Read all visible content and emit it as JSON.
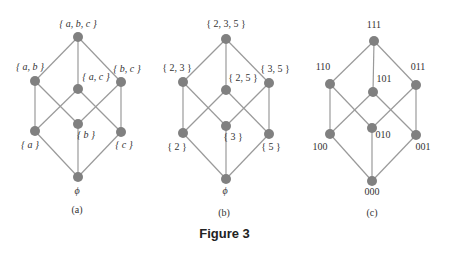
{
  "caption": "Figure   3",
  "colors": {
    "edge": "#9a9a9a",
    "node": "#808080",
    "text": "#333333"
  },
  "diagrams": [
    {
      "id": "a",
      "sublabel": "(a)",
      "nodes": [
        {
          "id": "abc",
          "label": "{ a, b, c }",
          "x": 78,
          "y": 37
        },
        {
          "id": "ab",
          "label": "{ a, b }",
          "x": 35,
          "y": 81
        },
        {
          "id": "ac",
          "label": "{ a, c }",
          "x": 78,
          "y": 89
        },
        {
          "id": "bc",
          "label": "{ b, c }",
          "x": 121,
          "y": 82
        },
        {
          "id": "a",
          "label": "{ a }",
          "x": 35,
          "y": 131
        },
        {
          "id": "b",
          "label": "{ b }",
          "x": 78,
          "y": 124
        },
        {
          "id": "c",
          "label": "{ c }",
          "x": 121,
          "y": 132
        },
        {
          "id": "empty",
          "label": "ϕ",
          "x": 78,
          "y": 177
        }
      ]
    },
    {
      "id": "b",
      "sublabel": "(b)",
      "nodes": [
        {
          "id": "235",
          "label": "{ 2, 3, 5 }",
          "x": 226,
          "y": 39
        },
        {
          "id": "23",
          "label": "{ 2, 3 }",
          "x": 183,
          "y": 82
        },
        {
          "id": "25",
          "label": "{ 2, 5 }",
          "x": 226,
          "y": 90
        },
        {
          "id": "35",
          "label": "{ 3, 5 }",
          "x": 269,
          "y": 83
        },
        {
          "id": "2",
          "label": "{ 2 }",
          "x": 183,
          "y": 133
        },
        {
          "id": "3",
          "label": "{ 3 }",
          "x": 226,
          "y": 126
        },
        {
          "id": "5",
          "label": "{ 5 }",
          "x": 269,
          "y": 134
        },
        {
          "id": "empty",
          "label": "ϕ",
          "x": 226,
          "y": 179
        }
      ]
    },
    {
      "id": "c",
      "sublabel": "(c)",
      "nodes": [
        {
          "id": "111",
          "label": "111",
          "x": 374,
          "y": 41
        },
        {
          "id": "110",
          "label": "110",
          "x": 330,
          "y": 84
        },
        {
          "id": "101",
          "label": "101",
          "x": 373,
          "y": 92
        },
        {
          "id": "011",
          "label": "011",
          "x": 416,
          "y": 85
        },
        {
          "id": "100",
          "label": "100",
          "x": 330,
          "y": 134
        },
        {
          "id": "010",
          "label": "010",
          "x": 372,
          "y": 128
        },
        {
          "id": "001",
          "label": "001",
          "x": 416,
          "y": 135
        },
        {
          "id": "000",
          "label": "000",
          "x": 372,
          "y": 181
        }
      ]
    }
  ],
  "edges": [
    [
      "top",
      "l"
    ],
    [
      "top",
      "m"
    ],
    [
      "top",
      "r"
    ],
    [
      "l",
      "bl"
    ],
    [
      "l",
      "bm"
    ],
    [
      "m",
      "bl"
    ],
    [
      "m",
      "br"
    ],
    [
      "r",
      "bm"
    ],
    [
      "r",
      "br"
    ],
    [
      "bl",
      "bot"
    ],
    [
      "bm",
      "bot"
    ],
    [
      "br",
      "bot"
    ]
  ]
}
